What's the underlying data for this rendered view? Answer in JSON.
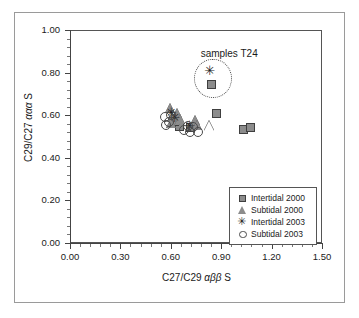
{
  "chart_data": {
    "type": "scatter",
    "title": "",
    "xlabel": "C27/C29 αββ S",
    "ylabel": "C29/C27 ααα S",
    "xlim": [
      0.0,
      1.5
    ],
    "ylim": [
      0.0,
      1.0
    ],
    "xticks": [
      "0.00",
      "0.30",
      "0.60",
      "0.90",
      "1.20",
      "1.50"
    ],
    "yticks": [
      "0.00",
      "0.20",
      "0.40",
      "0.60",
      "0.80",
      "1.00"
    ],
    "xtick_values": [
      0.0,
      0.3,
      0.6,
      0.9,
      1.2,
      1.5
    ],
    "ytick_values": [
      0.0,
      0.2,
      0.4,
      0.6,
      0.8,
      1.0
    ],
    "minor_ticks_per_interval": 5,
    "grid": false,
    "legend_position": "lower right",
    "series": [
      {
        "name": "Intertidal 2000",
        "marker": "square",
        "fill": "#8c8c8c",
        "edge": "#3f3f3f",
        "points": [
          [
            0.845,
            0.745
          ],
          [
            0.87,
            0.608
          ],
          [
            1.03,
            0.532
          ],
          [
            1.075,
            0.54
          ],
          [
            0.635,
            0.56
          ],
          [
            0.65,
            0.548
          ],
          [
            0.62,
            0.572
          ],
          [
            0.715,
            0.54
          ]
        ]
      },
      {
        "name": "Subtidal 2000",
        "marker": "triangle",
        "fill": "#8c8c8c",
        "edge": "#3f3f3f",
        "points": [
          [
            0.6,
            0.645
          ],
          [
            0.612,
            0.6
          ],
          [
            0.625,
            0.585
          ],
          [
            0.64,
            0.618
          ],
          [
            0.655,
            0.592
          ],
          [
            0.607,
            0.575
          ],
          [
            0.745,
            0.588
          ],
          [
            0.76,
            0.565
          ],
          [
            0.83,
            0.562
          ]
        ]
      },
      {
        "name": "Intertidal 2003",
        "marker": "star",
        "fill": "#1d1d1d",
        "edge": "#1d1d1d",
        "points": [
          [
            0.838,
            0.808
          ],
          [
            0.608,
            0.612
          ],
          [
            0.63,
            0.588
          ],
          [
            0.718,
            0.548
          ]
        ]
      },
      {
        "name": "Subtidal 2003",
        "marker": "circle-open",
        "fill": "none",
        "edge": "#4a4a4a",
        "points": [
          [
            0.565,
            0.592
          ],
          [
            0.57,
            0.555
          ],
          [
            0.588,
            0.568
          ],
          [
            0.6,
            0.6
          ],
          [
            0.7,
            0.548
          ],
          [
            0.712,
            0.52
          ],
          [
            0.735,
            0.545
          ],
          [
            0.762,
            0.522
          ],
          [
            0.68,
            0.53
          ]
        ]
      },
      {
        "name": "Subtidal 2000 open",
        "marker": "triangle-open",
        "fill": "#ffffff",
        "edge": "#555555",
        "points": [
          [
            0.828,
            0.558
          ]
        ]
      }
    ],
    "annotations": [
      {
        "text": "samples T24",
        "x": 0.98,
        "y": 0.885,
        "ellipse": {
          "cx": 0.845,
          "cy": 0.778,
          "rx": 0.105,
          "ry": 0.088,
          "style": "dotted"
        }
      }
    ]
  },
  "legend": {
    "entries": [
      {
        "label": "Intertidal 2000",
        "marker": "square"
      },
      {
        "label": "Subtidal 2000",
        "marker": "triangle"
      },
      {
        "label": "Intertidal 2003",
        "marker": "star"
      },
      {
        "label": "Subtidal 2003",
        "marker": "circle-open"
      }
    ]
  },
  "icons": {
    "star_glyph": "✳"
  }
}
